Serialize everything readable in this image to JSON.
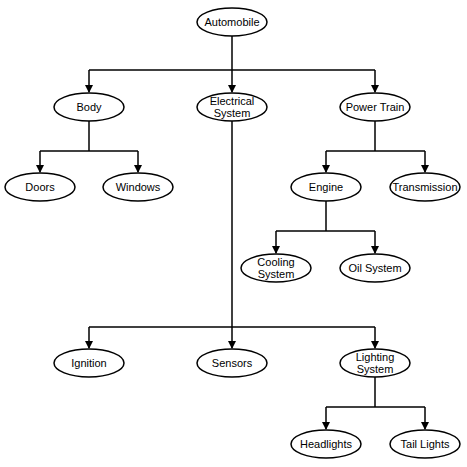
{
  "nodes": [
    {
      "id": "automobile",
      "lines": [
        "Automobile"
      ]
    },
    {
      "id": "body",
      "lines": [
        "Body"
      ]
    },
    {
      "id": "electrical-system",
      "lines": [
        "Electrical",
        "System"
      ]
    },
    {
      "id": "power-train",
      "lines": [
        "Power Train"
      ]
    },
    {
      "id": "doors",
      "lines": [
        "Doors"
      ]
    },
    {
      "id": "windows",
      "lines": [
        "Windows"
      ]
    },
    {
      "id": "engine",
      "lines": [
        "Engine"
      ]
    },
    {
      "id": "transmission",
      "lines": [
        "Transmission"
      ]
    },
    {
      "id": "cooling-system",
      "lines": [
        "Cooling",
        "System"
      ]
    },
    {
      "id": "oil-system",
      "lines": [
        "Oil System"
      ]
    },
    {
      "id": "ignition",
      "lines": [
        "Ignition"
      ]
    },
    {
      "id": "sensors",
      "lines": [
        "Sensors"
      ]
    },
    {
      "id": "lighting-system",
      "lines": [
        "Lighting",
        "System"
      ]
    },
    {
      "id": "headlights",
      "lines": [
        "Headlights"
      ]
    },
    {
      "id": "tail-lights",
      "lines": [
        "Tail Lights"
      ]
    }
  ],
  "edges": [
    {
      "from": "automobile",
      "to": [
        "body",
        "electrical-system",
        "power-train"
      ]
    },
    {
      "from": "body",
      "to": [
        "doors",
        "windows"
      ]
    },
    {
      "from": "power-train",
      "to": [
        "engine",
        "transmission"
      ]
    },
    {
      "from": "engine",
      "to": [
        "cooling-system",
        "oil-system"
      ]
    },
    {
      "from": "electrical-system",
      "to": [
        "ignition",
        "sensors",
        "lighting-system"
      ]
    },
    {
      "from": "lighting-system",
      "to": [
        "headlights",
        "tail-lights"
      ]
    }
  ]
}
